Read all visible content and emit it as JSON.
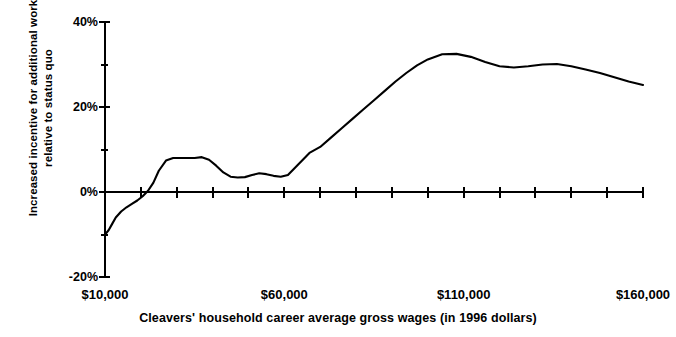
{
  "figure": {
    "cut_title_fragment": "",
    "background": "#ffffff",
    "ink_color": "#000000"
  },
  "chart_data": {
    "type": "line",
    "title": "",
    "xlabel": "Cleavers' household career average gross wages (in 1996 dollars)",
    "ylabel_line1": "Increased incentive for additional work",
    "ylabel_line2": "relative to status quo",
    "xlim": [
      10000,
      160000
    ],
    "ylim": [
      -20,
      40
    ],
    "grid": false,
    "legend": null,
    "xticklabels": [
      "$10,000",
      "$60,000",
      "$110,000",
      "$160,000"
    ],
    "xtickvalues": [
      10000,
      60000,
      110000,
      160000
    ],
    "x_minor_tick_step": 10000,
    "yticklabels": [
      "40%",
      "20%",
      "0%",
      "-20%"
    ],
    "ytickvalues": [
      40,
      20,
      0,
      -20
    ],
    "y_minor_tick_step": 10,
    "series": [
      {
        "name": "Increased incentive for additional work relative to status quo",
        "color": "#000000",
        "x": [
          10000,
          11000,
          12000,
          13000,
          14500,
          16000,
          17500,
          19000,
          20500,
          22000,
          23500,
          25000,
          27000,
          29000,
          31000,
          33000,
          35000,
          37000,
          39000,
          41000,
          43000,
          45000,
          47000,
          49000,
          51000,
          53000,
          55000,
          57000,
          59000,
          61000,
          64000,
          67000,
          70000,
          73000,
          76000,
          79000,
          82000,
          85000,
          88000,
          91000,
          94000,
          97000,
          100000,
          104000,
          108000,
          112000,
          116000,
          120000,
          124000,
          128000,
          132000,
          136000,
          140000,
          144000,
          148000,
          152000,
          156000,
          160000
        ],
        "y": [
          -10.0,
          -9.0,
          -7.5,
          -6.0,
          -4.6,
          -3.6,
          -2.8,
          -2.0,
          -1.0,
          0.3,
          2.2,
          5.0,
          7.4,
          8.0,
          8.0,
          8.0,
          8.0,
          8.2,
          7.6,
          6.2,
          4.6,
          3.6,
          3.4,
          3.5,
          4.0,
          4.4,
          4.2,
          3.8,
          3.6,
          4.0,
          6.6,
          9.2,
          10.6,
          12.8,
          15.0,
          17.2,
          19.4,
          21.6,
          23.8,
          26.0,
          28.0,
          29.8,
          31.2,
          32.4,
          32.5,
          31.8,
          30.6,
          29.6,
          29.3,
          29.6,
          30.0,
          30.1,
          29.6,
          28.8,
          28.0,
          27.0,
          26.0,
          25.2
        ]
      }
    ],
    "annotations": [
      {
        "text": "curve starts near -10% at $10,000",
        "value": -10
      },
      {
        "text": "plateau near 8% between roughly $20,000 and $39,000",
        "value": 8
      },
      {
        "text": "trough near 3.5% around $47,000",
        "value": 3.5
      },
      {
        "text": "peak near 32.5% around $108,000",
        "value": 32.5
      },
      {
        "text": "local dip near 29.3% around $124,000",
        "value": 29.3
      },
      {
        "text": "local rebound near 30.1% around $136,000",
        "value": 30.1
      },
      {
        "text": "minimum near 24.5% around $152,000 then rise to about 26% at $160,000",
        "value": 24.5
      }
    ]
  }
}
